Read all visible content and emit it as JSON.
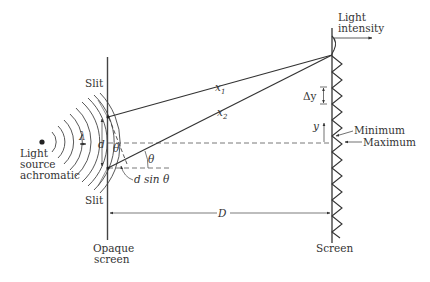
{
  "diagram": {
    "labels": {
      "light_source_line1": "Light",
      "light_source_line2": "source",
      "light_source_line3": "achromatic",
      "slit_top": "Slit",
      "slit_bottom": "Slit",
      "lambda": "λ",
      "d": "d",
      "theta_upper": "θ",
      "theta_lower": "θ",
      "d_sin_theta": "d sin θ",
      "x1": "x",
      "x1_sub": "1",
      "x2": "x",
      "x2_sub": "2",
      "delta_y": "Δy",
      "y": "y",
      "minimum": "Minimum",
      "maximum": "Maximum",
      "light_intensity_line1": "Light",
      "light_intensity_line2": "intensity",
      "D": "D",
      "opaque_screen_line1": "Opaque",
      "opaque_screen_line2": "screen",
      "screen": "Screen"
    },
    "colors": {
      "line": "#333333",
      "dashed": "#555555",
      "text": "#333333"
    }
  }
}
